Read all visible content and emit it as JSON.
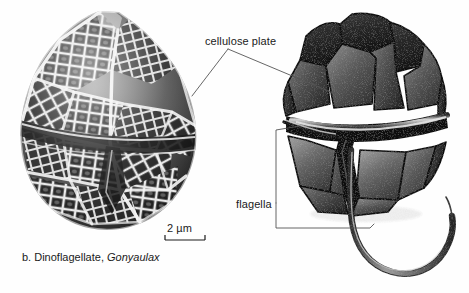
{
  "figure": {
    "panel_letter": "b.",
    "caption_prefix": "b. Dinoflagellate,",
    "caption_genus": "Gonyaulax",
    "background_color": "#fefefe",
    "text_color": "#1a1a1a",
    "leader_line_color": "#555555"
  },
  "labels": {
    "cellulose_plate": "cellulose plate",
    "flagella": "flagella"
  },
  "scalebar": {
    "value": "2",
    "unit": "µm",
    "text": "2 µm",
    "length_px": 40
  },
  "specimens": {
    "sem": {
      "name": "scanning electron micrograph of Gonyaulax theca",
      "tone_dark": "#151515",
      "tone_mid": "#7a7a7a",
      "tone_light": "#f2f2f2"
    },
    "drawing": {
      "name": "shaded drawing of armored Gonyaulax cell",
      "tone_dark": "#1c1c1c",
      "tone_mid": "#5e5e5e",
      "tone_light": "#cfcfcf",
      "flagellum_color": "#6b6b6b"
    }
  }
}
